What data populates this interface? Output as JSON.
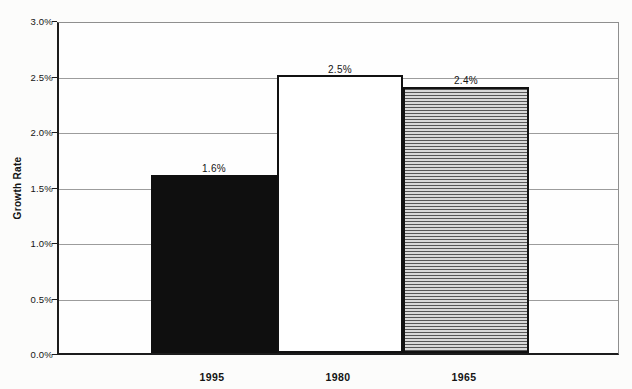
{
  "chart_data": {
    "type": "bar",
    "title": "",
    "ylabel": "Growth Rate",
    "xlabel": "",
    "categories": [
      "1995",
      "1980",
      "1965"
    ],
    "values": [
      1.6,
      2.5,
      2.4
    ],
    "value_labels": [
      "1.6%",
      "2.5%",
      "2.4%"
    ],
    "ylim": [
      0,
      3.0
    ],
    "ytick_step": 0.5,
    "ytick_labels_top_to_bottom": [
      "3.0%",
      "2.5%",
      "2.0%",
      "1.5%",
      "1.0%",
      "0.5%",
      "0.0%"
    ],
    "grid": "horizontal gridlines on",
    "legend": "none",
    "bar_fills": [
      "solid-black",
      "white-outline",
      "horizontal-hatch"
    ],
    "colors": {
      "bar_black": "#0f0f0f",
      "bar_white": "#ffffff",
      "bar_outline": "#111111",
      "hatch_line": "#565656",
      "hatch_background": "#d9d9d9",
      "gridline": "#9c9c9c",
      "axis": "#1c1c1c",
      "text": "#141414",
      "background": "#fcfcfb"
    }
  }
}
